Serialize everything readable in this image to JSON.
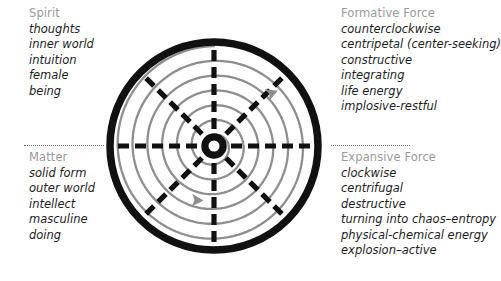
{
  "diagram": {
    "name": "polarity-wheel",
    "title_visible": false,
    "colors": {
      "heading": "#9a9a9a",
      "body": "#1d1d1d",
      "wheel_rim": "#111111",
      "spokes": "#111111",
      "spiral": "#8e8e8e",
      "background": "#ffffff"
    },
    "wheel": {
      "rim_style": "thick solid black circle",
      "spoke_count": 8,
      "spoke_style": "dashed",
      "spiral_turns": 6,
      "spiral_color": "#8e8e8e",
      "hub": "black ring with white center",
      "arrows": [
        {
          "name": "upper-arrow",
          "direction": "counterclockwise-inward",
          "position": "upper-right"
        },
        {
          "name": "lower-arrow",
          "direction": "clockwise-outward",
          "position": "lower-left"
        }
      ]
    }
  },
  "blocks": {
    "spirit": {
      "heading": "Spirit",
      "items": [
        "thoughts",
        "inner world",
        "intuition",
        "female",
        "being"
      ]
    },
    "matter": {
      "heading": "Matter",
      "items": [
        "solid form",
        "outer world",
        "intellect",
        "masculine",
        "doing"
      ]
    },
    "formative": {
      "heading": "Formative Force",
      "items": [
        "counterclockwise",
        "centripetal (center-seeking)",
        "constructive",
        "integrating",
        "life energy",
        "implosive-restful"
      ]
    },
    "expansive": {
      "heading": "Expansive Force",
      "items": [
        "clockwise",
        "centrifugal",
        "destructive",
        "turning into chaos–entropy",
        "physical-chemical energy",
        "explosion–active"
      ]
    }
  }
}
